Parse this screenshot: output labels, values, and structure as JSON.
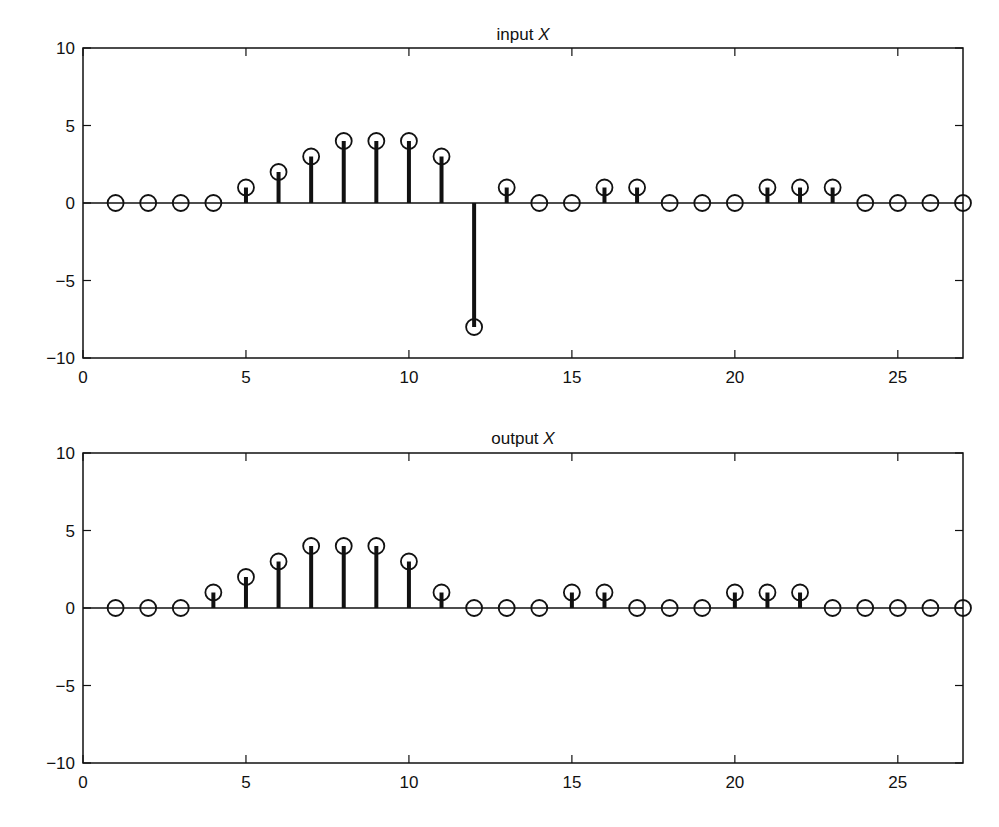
{
  "chart_data": [
    {
      "type": "stem",
      "title": "input X",
      "title_plain": "input ",
      "title_italic": "X",
      "xlabel": "",
      "ylabel": "",
      "xlim": [
        0,
        27
      ],
      "ylim": [
        -10,
        10
      ],
      "xticks": [
        0,
        5,
        10,
        15,
        20,
        25
      ],
      "yticks": [
        -10,
        -5,
        0,
        5,
        10
      ],
      "ytick_labels": [
        "−10",
        "−5",
        "0",
        "5",
        "10"
      ],
      "grid": false,
      "marker": "open-circle",
      "x": [
        1,
        2,
        3,
        4,
        5,
        6,
        7,
        8,
        9,
        10,
        11,
        12,
        13,
        14,
        15,
        16,
        17,
        18,
        19,
        20,
        21,
        22,
        23,
        24,
        25,
        26,
        27
      ],
      "values": [
        0,
        0,
        0,
        0,
        1,
        2,
        3,
        4,
        4,
        4,
        3,
        -8,
        1,
        0,
        0,
        1,
        1,
        0,
        0,
        0,
        1,
        1,
        1,
        0,
        0,
        0,
        0
      ]
    },
    {
      "type": "stem",
      "title": "output X",
      "title_plain": "output ",
      "title_italic": "X",
      "xlabel": "",
      "ylabel": "",
      "xlim": [
        0,
        27
      ],
      "ylim": [
        -10,
        10
      ],
      "xticks": [
        0,
        5,
        10,
        15,
        20,
        25
      ],
      "yticks": [
        -10,
        -5,
        0,
        5,
        10
      ],
      "ytick_labels": [
        "−10",
        "−5",
        "0",
        "5",
        "10"
      ],
      "grid": false,
      "marker": "open-circle",
      "x": [
        1,
        2,
        3,
        4,
        5,
        6,
        7,
        8,
        9,
        10,
        11,
        12,
        13,
        14,
        15,
        16,
        17,
        18,
        19,
        20,
        21,
        22,
        23,
        24,
        25,
        26,
        27
      ],
      "values": [
        0,
        0,
        0,
        1,
        2,
        3,
        4,
        4,
        4,
        3,
        1,
        0,
        0,
        0,
        1,
        1,
        0,
        0,
        0,
        1,
        1,
        1,
        0,
        0,
        0,
        0,
        0
      ]
    }
  ],
  "colors": {
    "ink": "#111111",
    "background": "#ffffff"
  }
}
